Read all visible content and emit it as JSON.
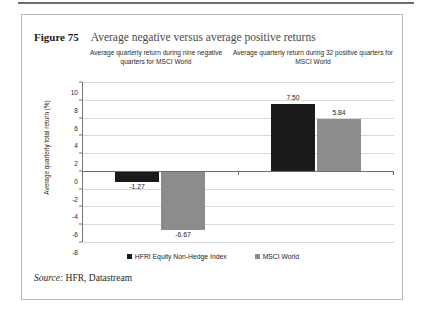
{
  "figure": {
    "number": "Figure 75",
    "title": "Average negative versus average positive returns",
    "source_word": "Source:",
    "source_text": " HFR, Datastream"
  },
  "group_headers": [
    "Average quarterly return during nine negative quarters for MSCI World",
    "Average quarterly return during 32 positive quarters for MSCI World"
  ],
  "colors": {
    "series_black": "#1b1b1b",
    "series_gray": "#8c8c8c",
    "gridline": "#d9d9d9",
    "axis": "#767676",
    "frame": "#b9b9b9"
  },
  "chart_data": {
    "type": "bar",
    "title": "Average negative versus average positive returns",
    "xlabel": "",
    "ylabel": "Average quarterly total return (%)",
    "ylim": [
      -8,
      10
    ],
    "ytick_step": 2,
    "yticks": [
      10,
      8,
      6,
      4,
      2,
      0,
      -2,
      -4,
      -6,
      -8
    ],
    "ytick_labels": [
      "10",
      "8",
      "6",
      "4",
      "2",
      "0",
      "-2",
      "-4",
      "-6",
      "-8"
    ],
    "grid": true,
    "legend_position": "bottom",
    "categories": [
      "Average quarterly return during nine negative quarters for MSCI World",
      "Average quarterly return during 32 positive quarters for MSCI World"
    ],
    "series": [
      {
        "name": "HFRI Equity Non-Hedge Index",
        "color": "#1b1b1b",
        "values": [
          -1.27,
          7.5
        ],
        "labels": [
          "-1.27",
          "7.50"
        ]
      },
      {
        "name": "MSCI World",
        "color": "#8c8c8c",
        "values": [
          -6.67,
          5.84
        ],
        "labels": [
          "-6.67",
          "5.84"
        ]
      }
    ]
  }
}
